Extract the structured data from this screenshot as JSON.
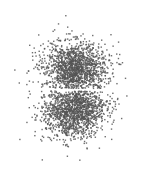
{
  "chart_data": {
    "type": "scatter",
    "title": "",
    "xlabel": "",
    "ylabel": "",
    "grid": false,
    "legend": null,
    "axes_visible": false,
    "point_color": "#555555",
    "background": "#ffffff",
    "point_size_px": 1.4,
    "point_opacity": 0.85,
    "clusters": [
      {
        "name": "upper-lobe",
        "center_px": [
          75,
          68
        ],
        "spread_px": [
          16,
          13
        ],
        "count": 1500,
        "clip_y_max": 88.5
      },
      {
        "name": "lower-lobe",
        "center_px": [
          74,
          110
        ],
        "spread_px": [
          16,
          14
        ],
        "count": 1500,
        "clip_y_min": 91
      }
    ],
    "gap_y_px": [
      88.5,
      91
    ],
    "canvas_px": [
      149,
      179
    ]
  }
}
